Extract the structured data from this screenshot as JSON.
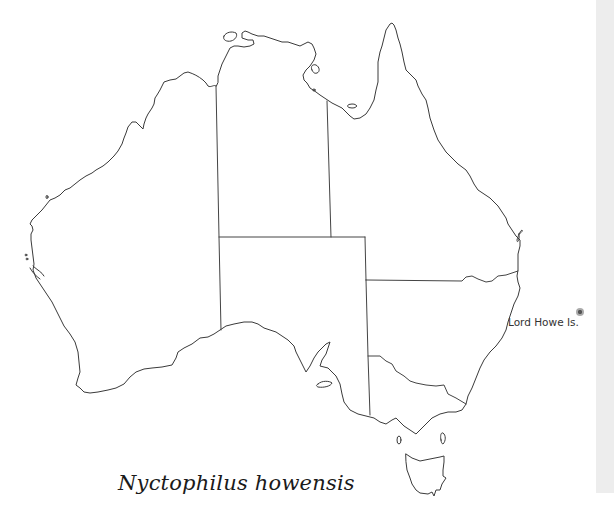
{
  "map": {
    "title": "Australia distribution map",
    "species_name": "Nyctophilus howensis",
    "regions": [
      "Western Australia",
      "Northern Territory",
      "Queensland",
      "South Australia",
      "New South Wales",
      "Victoria",
      "Tasmania"
    ],
    "annotations": [
      {
        "label": "Lord Howe Is.",
        "marker": "filled-dot"
      }
    ],
    "colors": {
      "outline": "#3a3a3a",
      "background": "#ffffff",
      "side_strip": "#ededed",
      "marker": "#555555"
    }
  }
}
